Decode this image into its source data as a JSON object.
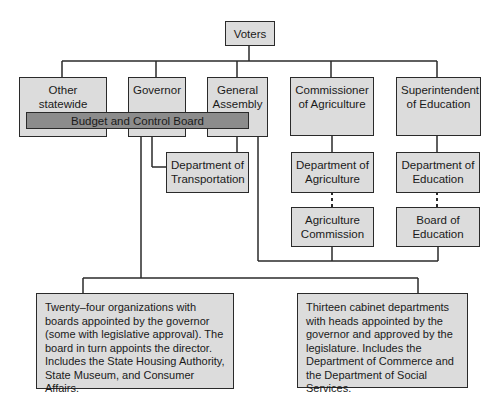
{
  "diagram": {
    "type": "org-chart",
    "nodes": {
      "voters": "Voters",
      "other_offices": "Other statewide offices",
      "governor": "Governor",
      "general_assembly": "General Assembly",
      "commissioner_agriculture": "Commissioner of Agriculture",
      "superintendent_education": "Superintendent of Education",
      "budget_board": "Budget and Control Board",
      "dept_transportation": "Department of Transportation",
      "dept_agriculture": "Department of Agriculture",
      "agriculture_commission": "Agriculture Commission",
      "dept_education": "Department of Education",
      "board_education": "Board of Education",
      "boards_note": "Twenty–four organizations with boards appointed by the governor (some with legislative approval). The board in turn appoints the director. Includes the State Housing Authority, State Museum, and Consumer Affairs.",
      "cabinet_note": "Thirteen cabinet departments with heads appointed by the governor and approved by the legislature. Includes the Department of Commerce and the Department of Social Services."
    },
    "colors": {
      "box_fill": "#dcdcdc",
      "bar_fill": "#8c8c8c",
      "line": "#2a2a2a"
    }
  }
}
